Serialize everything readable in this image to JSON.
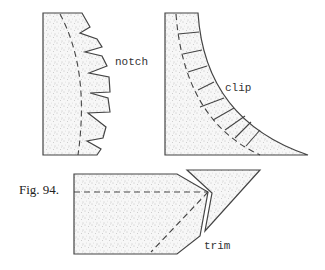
{
  "figure": {
    "caption": "Fig. 94.",
    "panels": [
      {
        "id": "notch",
        "label": "notch"
      },
      {
        "id": "clip",
        "label": "clip"
      },
      {
        "id": "trim",
        "label": "trim"
      }
    ]
  },
  "colors": {
    "ink": "#444444",
    "paper": "#ffffff",
    "stipple": "#9a9a9a"
  }
}
